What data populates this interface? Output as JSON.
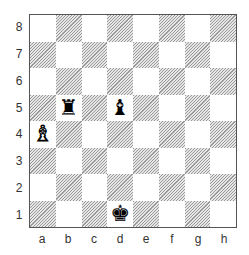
{
  "board": {
    "ranks": [
      "8",
      "7",
      "6",
      "5",
      "4",
      "3",
      "2",
      "1"
    ],
    "files": [
      "a",
      "b",
      "c",
      "d",
      "e",
      "f",
      "g",
      "h"
    ],
    "colors": {
      "light": "#ffffff",
      "dark_hatch": "#9a9a9a",
      "border": "#555555"
    },
    "pieces": [
      {
        "square": "b5",
        "type": "rook",
        "color": "black",
        "glyph": "♜"
      },
      {
        "square": "d5",
        "type": "bishop",
        "color": "black",
        "glyph": "♝"
      },
      {
        "square": "a4",
        "type": "bishop",
        "color": "white",
        "glyph": "♗"
      },
      {
        "square": "d1",
        "type": "king",
        "color": "black",
        "glyph": "♚"
      }
    ]
  }
}
